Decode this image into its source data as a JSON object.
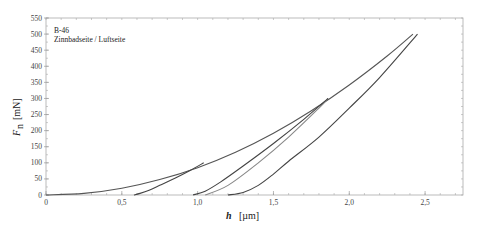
{
  "chart_data": {
    "type": "line",
    "title": "",
    "annotation": [
      "B-46",
      "Zinnbadseite / Luftseite"
    ],
    "xlabel_symbol": "h",
    "xlabel_unit": "[µm]",
    "ylabel_symbol": "F",
    "ylabel_subscript": "n",
    "ylabel_unit": "[mN]",
    "xlim": [
      0,
      2.75
    ],
    "ylim": [
      0,
      550
    ],
    "xticks": [
      0,
      0.5,
      1.0,
      1.5,
      2.0,
      2.5
    ],
    "xtick_labels": [
      "0",
      "0,5",
      "1,0",
      "1,5",
      "2,0",
      "2,5"
    ],
    "yticks": [
      0,
      50,
      100,
      150,
      200,
      250,
      300,
      350,
      400,
      450,
      500,
      550
    ],
    "ytick_labels": [
      "0",
      "50",
      "100",
      "150",
      "200",
      "250",
      "300",
      "350",
      "400",
      "450",
      "500",
      "550"
    ],
    "grid": false,
    "legend": null,
    "series": [
      {
        "name": "loading",
        "color": "#555555",
        "x": [
          0,
          0.25,
          0.5,
          0.75,
          1.0,
          1.25,
          1.5,
          1.75,
          2.0,
          2.25,
          2.42
        ],
        "y": [
          0,
          5,
          21,
          48,
          85,
          133,
          192,
          262,
          342,
          432,
          500
        ]
      },
      {
        "name": "unloading 100 mN",
        "color": "#444444",
        "x": [
          1.04,
          0.95,
          0.85,
          0.75,
          0.68,
          0.62,
          0.58
        ],
        "y": [
          100,
          76,
          52,
          30,
          15,
          5,
          0
        ]
      },
      {
        "name": "reloading 300 mN",
        "color": "#888888",
        "x": [
          1.05,
          1.2,
          1.4,
          1.6,
          1.8,
          1.86
        ],
        "y": [
          0,
          30,
          100,
          180,
          270,
          300
        ]
      },
      {
        "name": "unloading 300 mN",
        "color": "#444444",
        "x": [
          1.86,
          1.7,
          1.5,
          1.3,
          1.15,
          1.05,
          0.97
        ],
        "y": [
          300,
          235,
          160,
          90,
          40,
          12,
          0
        ]
      },
      {
        "name": "unloading 500 mN",
        "color": "#444444",
        "x": [
          2.45,
          2.2,
          2.0,
          1.8,
          1.6,
          1.5,
          1.4,
          1.3,
          1.2
        ],
        "y": [
          500,
          365,
          270,
          180,
          105,
          65,
          30,
          8,
          0
        ]
      }
    ]
  }
}
